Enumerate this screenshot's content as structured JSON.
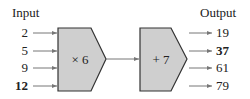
{
  "diagram": {
    "input_label": "Input",
    "output_label": "Output",
    "inputs": [
      {
        "value": "2",
        "bold": false
      },
      {
        "value": "5",
        "bold": false
      },
      {
        "value": "9",
        "bold": false
      },
      {
        "value": "12",
        "bold": true
      }
    ],
    "machines": [
      {
        "operation": "× 6"
      },
      {
        "operation": "+ 7"
      }
    ],
    "outputs": [
      {
        "value": "19",
        "bold": false
      },
      {
        "value": "37",
        "bold": true
      },
      {
        "value": "61",
        "bold": false
      },
      {
        "value": "79",
        "bold": false
      }
    ],
    "colors": {
      "machine_fill": "#cfcfcf",
      "machine_stroke": "#333333",
      "arrow": "#777777"
    }
  }
}
